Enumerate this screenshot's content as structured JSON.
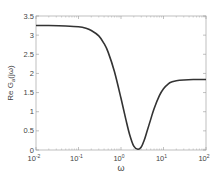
{
  "chart_data": {
    "type": "line",
    "title": "",
    "xlabel": "ω",
    "ylabel": "Re G_a(jω)",
    "xscale": "log",
    "xlim": [
      0.01,
      100
    ],
    "ylim": [
      0,
      3.5
    ],
    "grid": false,
    "legend": null,
    "x_ticks": [
      "10^-2",
      "10^-1",
      "10^0",
      "10^1",
      "10^2"
    ],
    "x_tick_values": [
      0.01,
      0.1,
      1,
      10,
      100
    ],
    "y_ticks": [
      "0",
      "0.5",
      "1",
      "1.5",
      "2",
      "2.5",
      "3",
      "3.5"
    ],
    "y_tick_values": [
      0,
      0.5,
      1,
      1.5,
      2,
      2.5,
      3,
      3.5
    ],
    "series": [
      {
        "name": "Re G_a(jω)",
        "color": "#333333",
        "x": [
          0.01,
          0.02,
          0.05,
          0.1,
          0.15,
          0.2,
          0.3,
          0.4,
          0.5,
          0.7,
          1.0,
          1.3,
          1.6,
          2.0,
          2.5,
          3.0,
          3.5,
          4.0,
          5.0,
          6.0,
          8.0,
          10,
          13,
          16,
          20,
          30,
          50,
          100
        ],
        "values": [
          3.25,
          3.25,
          3.24,
          3.22,
          3.18,
          3.12,
          2.98,
          2.78,
          2.55,
          2.05,
          1.35,
          0.8,
          0.4,
          0.1,
          0.02,
          0.08,
          0.25,
          0.45,
          0.8,
          1.08,
          1.42,
          1.6,
          1.73,
          1.78,
          1.81,
          1.83,
          1.84,
          1.84
        ]
      }
    ]
  }
}
